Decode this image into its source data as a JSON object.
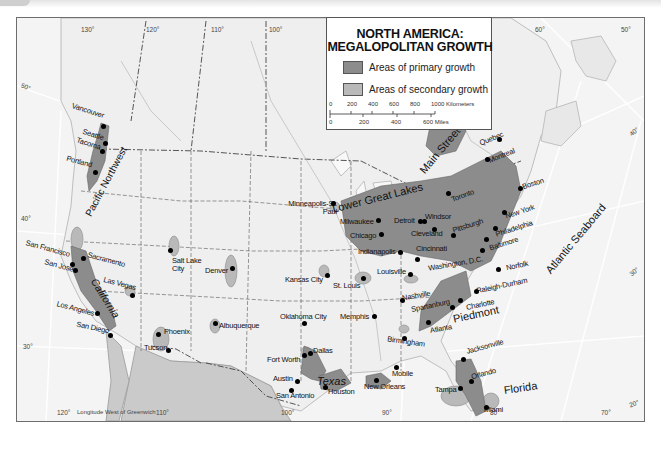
{
  "map": {
    "title_line1": "NORTH AMERICA:",
    "title_line2": "MEGALOPOLITAN GROWTH",
    "colors": {
      "primary_growth": "#8c8c8c",
      "secondary_growth": "#b9b9b9",
      "land": "#f0f0f0",
      "mexico": "#c9c9c9",
      "ocean": "#f4f4f4"
    },
    "legend": {
      "primary_label": "Areas of primary growth",
      "secondary_label": "Areas of secondary growth",
      "scale_km_ticks": [
        "0",
        "200",
        "400",
        "600",
        "800",
        "1000 Kilometers"
      ],
      "scale_mi_ticks": [
        "0",
        "200",
        "400",
        "600 Miles"
      ]
    },
    "footer_note": "Longitude West of Greenwich",
    "longitude_labels_top": [
      "130°",
      "120°",
      "110°",
      "100°",
      "60°",
      "50°"
    ],
    "longitude_labels_bottom": [
      "120°",
      "110°",
      "100°",
      "90°",
      "80°",
      "70°"
    ],
    "latitude_labels": [
      "50°",
      "40°",
      "30°",
      "40°",
      "30°",
      "20°"
    ],
    "regions": [
      "Pacific Northwest",
      "California",
      "Texas",
      "Lower Great Lakes",
      "Main Street",
      "Atlantic Seaboard",
      "Piedmont",
      "Florida"
    ],
    "cities": [
      "Vancouver",
      "Seattle",
      "Tacoma",
      "Portland",
      "San Francisco",
      "San José",
      "Sacramento",
      "Los Angeles",
      "San Diego",
      "Las Vegas",
      "Salt Lake City",
      "Denver",
      "Phoenix",
      "Tucson",
      "Albuquerque",
      "Minneapolis-St. Paul",
      "Kansas City",
      "St. Louis",
      "Oklahoma City",
      "Memphis",
      "Fort Worth",
      "Dallas",
      "Austin",
      "San Antonio",
      "Houston",
      "New Orleans",
      "Mobile",
      "Milwaukee",
      "Chicago",
      "Detroit",
      "Windsor",
      "Toronto",
      "Cleveland",
      "Pittsburgh",
      "Indianapolis",
      "Cincinnati",
      "Louisville",
      "Nashville",
      "Birmingham",
      "Atlanta",
      "Spartanburg",
      "Charlotte",
      "Raleigh-Durham",
      "Norfolk",
      "Washington, D.C.",
      "Baltimore",
      "Philadelphia",
      "New York",
      "Boston",
      "Montreal",
      "Quebec",
      "Jacksonville",
      "Orlando",
      "Tampa",
      "Miami"
    ]
  }
}
